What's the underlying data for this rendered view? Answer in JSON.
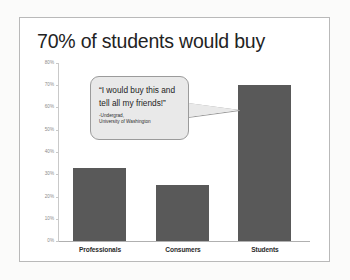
{
  "slide": {
    "title": "70% of students would buy"
  },
  "callout": {
    "quote": "“I would buy this and tell all my friends!”",
    "attribution_line1": "-Undergrad,",
    "attribution_line2": "University of Washington"
  },
  "colors": {
    "bar_fill": "#595959",
    "callout_fill": "#e9e9e9",
    "callout_border": "#9b9b9b",
    "axis": "#c9c9c9",
    "tick_label": "#8a8a8a",
    "title_text": "#232323",
    "slide_border": "#b9b9b9"
  },
  "chart_data": {
    "type": "bar",
    "title": "70% of students would buy",
    "xlabel": "",
    "ylabel": "",
    "categories": [
      "Professionals",
      "Consumers",
      "Students"
    ],
    "values": [
      33,
      25,
      70
    ],
    "value_suffix": "%",
    "ylim": [
      0,
      80
    ],
    "yticks": [
      0,
      10,
      20,
      30,
      40,
      50,
      60,
      70,
      80
    ],
    "ytick_labels": [
      "0%",
      "10%",
      "20%",
      "30%",
      "40%",
      "50%",
      "60%",
      "70%",
      "80%"
    ],
    "grid": false,
    "legend": "none",
    "series": [
      {
        "name": "Would buy",
        "values": [
          33,
          25,
          70
        ]
      }
    ],
    "annotations": [
      {
        "text": "“I would buy this and tell all my friends!” -Undergrad, University of Washington",
        "points_to": "Students"
      }
    ]
  }
}
